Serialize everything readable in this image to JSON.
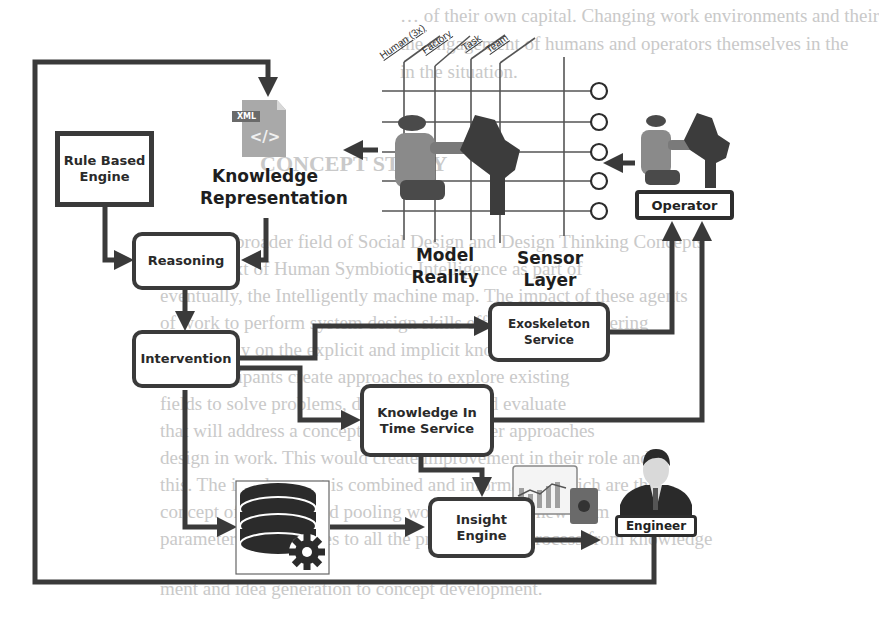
{
  "background_text": [
    "… of their own capital. Changing work environments and their",
    "the engagement of humans and operators themselves in the",
    "in the situation.",
    "CONCEPT STORY",
    "Since the broader field of Social Design and Design Thinking Concepts",
    "in a context of Human Symbiotic Intelligence as part of",
    "eventually, the Intelligently machine map. The impact of these agents",
    "of work to perform system design skills effectively. Engineering",
    "rely heavily on the explicit and implicit knowledge.",
    "The participants create approaches to explore existing",
    "fields to solve problems, design, realize, and evaluate",
    "that will address a concept compared to other approaches",
    "design in work. This would create improvement in their role and",
    "this. The involvement is combined and information which are the",
    "concept of learning and pooling work tasks. This new form",
    "parameters uses applies to all the process of the process from knowledge",
    "ment and idea generation to concept development."
  ],
  "nodes": {
    "rule_engine": "Rule Based\nEngine",
    "reasoning": "Reasoning",
    "intervention": "Intervention",
    "exoskeleton": "Exoskeleton\nService",
    "knowledge_time": "Knowledge In\nTime Service",
    "insight": "Insight\nEngine",
    "operator": "Operator",
    "engineer": "Engineer"
  },
  "labels": {
    "knowledge_rep_line1": "Knowledge",
    "knowledge_rep_line2": "Representation",
    "model_line1": "Model",
    "model_line2": "Reality",
    "sensor_line1": "Sensor",
    "sensor_line2": "Layer",
    "xml_badge": "XML",
    "xml_glyph": "</>"
  },
  "grid_axes": [
    "Human (3x)",
    "Factory",
    "Task",
    "Team"
  ],
  "sensor_count": 5,
  "colors": {
    "line": "#3a3a3a",
    "box_border": "#3a3a3a",
    "xml_icon": "#a9a9a9",
    "bg_text": "#c9c9c9"
  }
}
